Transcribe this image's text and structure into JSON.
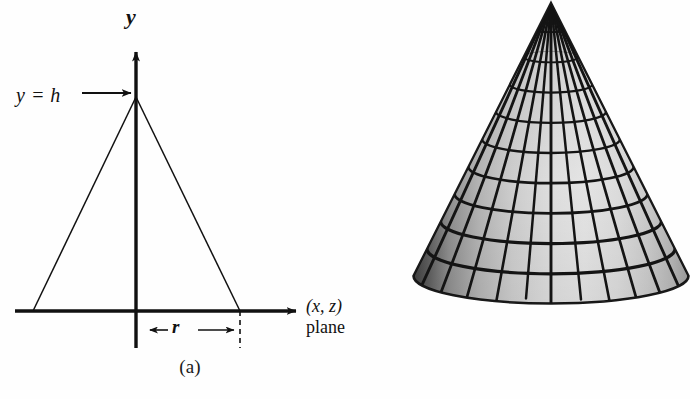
{
  "figure": {
    "background_color": "#fefefe",
    "stroke_color": "#111111"
  },
  "panel_a": {
    "name": "cross-section-diagram",
    "caption": "(a)",
    "labels": {
      "y_axis": "y",
      "height_label": "y = h",
      "radius_label": "r",
      "plane_label_line1": "(x, z)",
      "plane_label_line2": "plane"
    },
    "geometry": {
      "origin_x": 136,
      "axis_y": 311,
      "apex_x": 136,
      "apex_y": 97,
      "base_left_x": 33,
      "base_right_x": 240,
      "x_axis_start": 15,
      "x_axis_end": 300,
      "y_axis_top": 46,
      "y_axis_bottom": 348
    }
  },
  "panel_b": {
    "name": "shaded-cone-render",
    "caption": "(b)",
    "geometry": {
      "apex_x": 551,
      "apex_y": 42,
      "base_center_x": 550,
      "base_center_y": 318,
      "base_radius_x": 138,
      "base_radius_y": 28
    },
    "mesh": {
      "latitude_rings": 10,
      "meridians": 12
    },
    "shading": {
      "highlight_color": "#e8e8e8",
      "midtone_color": "#c6c6c6",
      "shadow_color": "#6b6b6b",
      "deep_shadow_color": "#4a4a4a",
      "wire_color": "#141414"
    }
  }
}
